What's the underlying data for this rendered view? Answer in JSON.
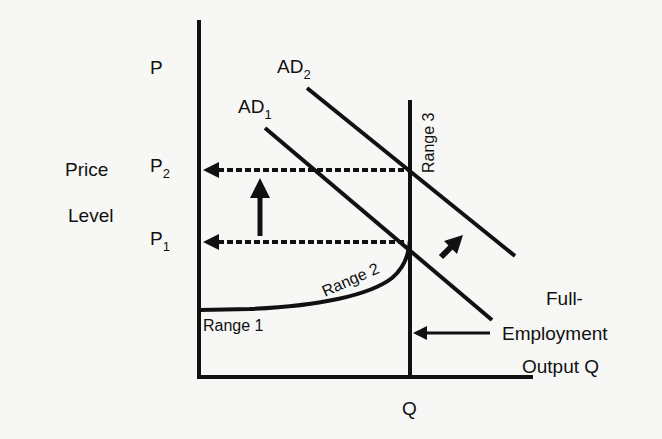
{
  "diagram": {
    "y_axis": {
      "symbol": "P",
      "label_line1": "Price",
      "label_line2": "Level"
    },
    "x_axis": {
      "symbol": "Q"
    },
    "price_levels": [
      {
        "base": "P",
        "sub": "2"
      },
      {
        "base": "P",
        "sub": "1"
      }
    ],
    "curves": [
      {
        "base": "AD",
        "sub": "1"
      },
      {
        "base": "AD",
        "sub": "2"
      }
    ],
    "ranges": [
      "Range 1",
      "Range 2",
      "Range 3"
    ],
    "annotation": {
      "line1": "Full-",
      "line2": "Employment",
      "line3": "Output Q"
    },
    "colors": {
      "ink": "#111111",
      "background": "#f7f7f5"
    }
  }
}
